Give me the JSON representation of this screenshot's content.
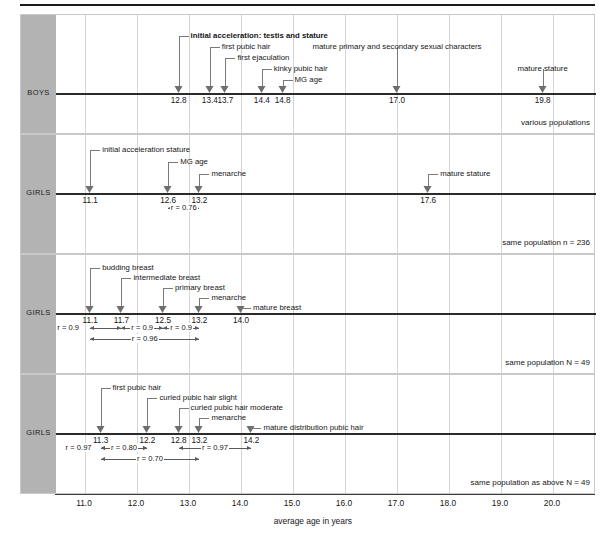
{
  "figure": {
    "axis_title": "average age in years",
    "x_ticks": [
      "11.0",
      "12.0",
      "13.0",
      "14.0",
      "15.0",
      "16.0",
      "17.0",
      "18.0",
      "19.0",
      "20.0"
    ],
    "x_tick_values": [
      11,
      12,
      13,
      14,
      15,
      16,
      17,
      18,
      19,
      20
    ]
  },
  "chart_data": {
    "type": "scatter",
    "title": "",
    "xlabel": "average age in years",
    "ylabel": "",
    "xlim": [
      10.5,
      20.6
    ],
    "grid": true,
    "legend": "none",
    "panels": [
      {
        "group_label": "BOYS",
        "note": "various populations",
        "events": [
          {
            "label": "initial acceleration: testis and stature",
            "value": 12.8,
            "value_text": "12.8",
            "bold": true
          },
          {
            "label": "first pubic hair",
            "value": 13.4,
            "value_text": "13.4",
            "bold": false
          },
          {
            "label": "first ejaculation",
            "value": 13.7,
            "value_text": "13.7",
            "bold": false
          },
          {
            "label": "kinky pubic hair",
            "value": 14.4,
            "value_text": "14.4",
            "bold": false
          },
          {
            "label": "MG age",
            "value": 14.8,
            "value_text": "14.8",
            "bold": false
          },
          {
            "label": "mature primary and secondary sexual characters",
            "value": 17.0,
            "value_text": "17.0",
            "bold": false
          },
          {
            "label": "mature stature",
            "value": 19.8,
            "value_text": "19.8",
            "bold": false
          }
        ],
        "correlations": []
      },
      {
        "group_label": "GIRLS",
        "note": "same population n = 236",
        "events": [
          {
            "label": "initial acceleration stature",
            "value": 11.1,
            "value_text": "11.1",
            "bold": false
          },
          {
            "label": "MG age",
            "value": 12.6,
            "value_text": "12.6",
            "bold": false
          },
          {
            "label": "menarche",
            "value": 13.2,
            "value_text": "13.2",
            "bold": false
          },
          {
            "label": "mature stature",
            "value": 17.6,
            "value_text": "17.6",
            "bold": false
          }
        ],
        "correlations": [
          {
            "text": "r = 0.76",
            "from": 12.6,
            "to": 13.2,
            "row": 0
          }
        ]
      },
      {
        "group_label": "GIRLS",
        "note": "same population N = 49",
        "events": [
          {
            "label": "budding breast",
            "value": 11.1,
            "value_text": "11.1",
            "bold": false
          },
          {
            "label": "intermediate breast",
            "value": 11.7,
            "value_text": "11.7",
            "bold": false
          },
          {
            "label": "primary breast",
            "value": 12.5,
            "value_text": "12.5",
            "bold": false
          },
          {
            "label": "menarche",
            "value": 13.2,
            "value_text": "13.2",
            "bold": false
          },
          {
            "label": "mature breast",
            "value": 14.0,
            "value_text": "14.0",
            "bold": false
          }
        ],
        "correlations": [
          {
            "text": "r = 0.9",
            "from": 11.1,
            "to": 11.7,
            "row": 0,
            "label_outside": true
          },
          {
            "text": "r = 0.9",
            "from": 11.7,
            "to": 12.5,
            "row": 0
          },
          {
            "text": "r = 0.9",
            "from": 12.5,
            "to": 13.2,
            "row": 0
          },
          {
            "text": "r = 0.96",
            "from": 11.1,
            "to": 13.2,
            "row": 1
          }
        ]
      },
      {
        "group_label": "GIRLS",
        "note": "same population as above N = 49",
        "events": [
          {
            "label": "first pubic hair",
            "value": 11.3,
            "value_text": "11.3",
            "bold": false
          },
          {
            "label": "curled pubic hair slight",
            "value": 12.2,
            "value_text": "12.2",
            "bold": false
          },
          {
            "label": "curled pubic hair moderate",
            "value": 12.8,
            "value_text": "12.8",
            "bold": false
          },
          {
            "label": "menarche",
            "value": 13.2,
            "value_text": "13.2",
            "bold": false
          },
          {
            "label": "mature distribution pubic hair",
            "value": 14.2,
            "value_text": "14.2",
            "bold": false
          }
        ],
        "correlations": [
          {
            "text": "r = 0.97",
            "from": 11.3,
            "to": 12.2,
            "row": 0,
            "label_outside": true
          },
          {
            "text": "r = 0.97",
            "from": 12.8,
            "to": 14.2,
            "row": 0
          },
          {
            "text": "r = 0.80",
            "from": 11.3,
            "to": 12.2,
            "row": 0,
            "inner": true
          },
          {
            "text": "r = 0.70",
            "from": 11.3,
            "to": 13.2,
            "row": 1
          }
        ]
      }
    ]
  }
}
